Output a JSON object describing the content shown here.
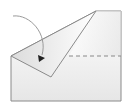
{
  "diagram": {
    "type": "origami-fold-step",
    "colors": {
      "outline": "#8a8a8a",
      "fill_top": "#ffffff",
      "fill_bottom": "#e6e6e6",
      "flap_fill_top": "#e4e4e4",
      "flap_fill_bottom": "#ffffff",
      "arrow": "#999999",
      "arrowhead": "#222222",
      "dashed_line": "#888888"
    },
    "shapes": {
      "paper_outline": [
        [
          11,
          56
        ],
        [
          96,
          11
        ],
        [
          121,
          11
        ],
        [
          121,
          101
        ],
        [
          11,
          101
        ]
      ],
      "folded_flap": [
        [
          11,
          56
        ],
        [
          96,
          11
        ],
        [
          51,
          77
        ]
      ],
      "dashed_fold_line": {
        "x1": 69,
        "y1": 56,
        "x2": 121,
        "y2": 56
      },
      "arrow_path": "M13,16 C30,14 48,34 41,57",
      "arrowhead_tip": [
        40,
        59
      ]
    },
    "icons": {
      "fold_arrow": "curved-arrow-icon"
    }
  }
}
